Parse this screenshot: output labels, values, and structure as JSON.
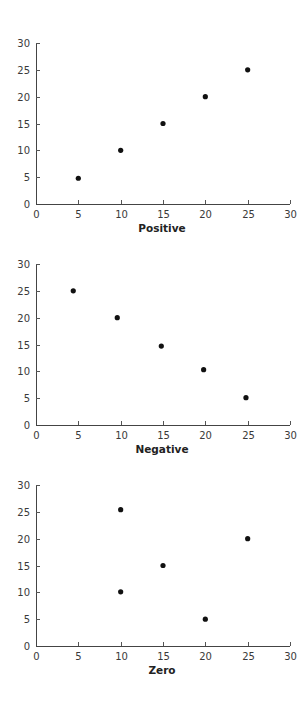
{
  "charts": [
    {
      "title": "Positive",
      "top": 35
    },
    {
      "title": "Negative",
      "top": 256
    },
    {
      "title": "Zero",
      "top": 477
    }
  ],
  "axes": {
    "x_ticks": [
      "0",
      "5",
      "10",
      "15",
      "20",
      "25",
      "30"
    ],
    "y_ticks": [
      "0",
      "5",
      "10",
      "15",
      "20",
      "25",
      "30"
    ],
    "xlim": [
      0,
      30
    ],
    "ylim": [
      0,
      30
    ]
  },
  "colors": {
    "point": "#111111",
    "axis": "#444444",
    "text": "#3a3a3a"
  },
  "chart_data": [
    {
      "type": "scatter",
      "title": "Positive",
      "xlabel": "Positive",
      "ylabel": "",
      "xlim": [
        0,
        30
      ],
      "ylim": [
        0,
        30
      ],
      "x_ticks": [
        0,
        5,
        10,
        15,
        20,
        25,
        30
      ],
      "y_ticks": [
        0,
        5,
        10,
        15,
        20,
        25,
        30
      ],
      "grid": false,
      "legend": null,
      "series": [
        {
          "name": "Positive",
          "points": [
            {
              "x": 5,
              "y": 4.8
            },
            {
              "x": 10,
              "y": 10
            },
            {
              "x": 15,
              "y": 15
            },
            {
              "x": 20,
              "y": 20
            },
            {
              "x": 25,
              "y": 25
            }
          ]
        }
      ]
    },
    {
      "type": "scatter",
      "title": "Negative",
      "xlabel": "Negative",
      "ylabel": "",
      "xlim": [
        0,
        30
      ],
      "ylim": [
        0,
        30
      ],
      "x_ticks": [
        0,
        5,
        10,
        15,
        20,
        25,
        30
      ],
      "y_ticks": [
        0,
        5,
        10,
        15,
        20,
        25,
        30
      ],
      "grid": false,
      "legend": null,
      "series": [
        {
          "name": "Negative",
          "points": [
            {
              "x": 4.4,
              "y": 25
            },
            {
              "x": 9.6,
              "y": 20
            },
            {
              "x": 14.8,
              "y": 14.7
            },
            {
              "x": 19.8,
              "y": 10.3
            },
            {
              "x": 24.8,
              "y": 5.1
            }
          ]
        }
      ]
    },
    {
      "type": "scatter",
      "title": "Zero",
      "xlabel": "Zero",
      "ylabel": "",
      "xlim": [
        0,
        30
      ],
      "ylim": [
        0,
        30
      ],
      "x_ticks": [
        0,
        5,
        10,
        15,
        20,
        25,
        30
      ],
      "y_ticks": [
        0,
        5,
        10,
        15,
        20,
        25,
        30
      ],
      "grid": false,
      "legend": null,
      "series": [
        {
          "name": "Zero",
          "points": [
            {
              "x": 10,
              "y": 25.4
            },
            {
              "x": 10,
              "y": 10.1
            },
            {
              "x": 15,
              "y": 15
            },
            {
              "x": 20,
              "y": 5
            },
            {
              "x": 25,
              "y": 20
            }
          ]
        }
      ]
    }
  ]
}
